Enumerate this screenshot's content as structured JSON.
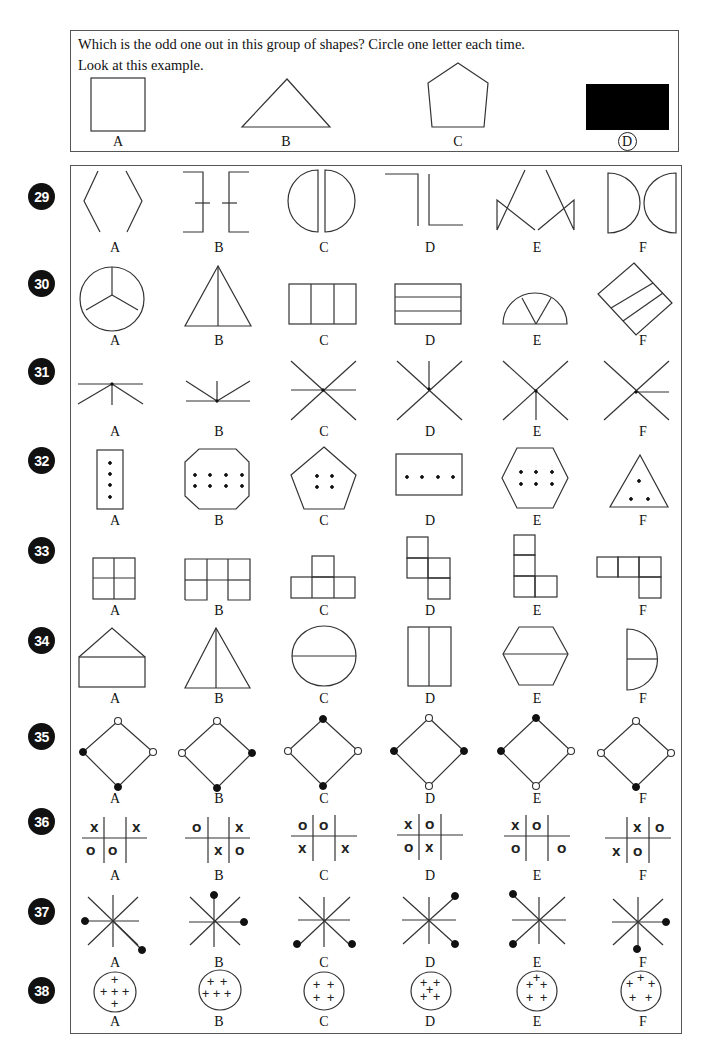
{
  "instructions": {
    "line1": "Which is the odd one out in this group of shapes? Circle one letter each time.",
    "line2": "Look at this example."
  },
  "example": {
    "options": [
      {
        "letter": "A",
        "shape": "square",
        "circled": false
      },
      {
        "letter": "B",
        "shape": "triangle",
        "circled": false
      },
      {
        "letter": "C",
        "shape": "pentagon",
        "circled": false
      },
      {
        "letter": "D",
        "shape": "filled-rectangle",
        "circled": true
      }
    ]
  },
  "questions": [
    {
      "number": "29",
      "letters": [
        "A",
        "B",
        "C",
        "D",
        "E",
        "F"
      ],
      "theme": "split symmetric line pairs"
    },
    {
      "number": "30",
      "letters": [
        "A",
        "B",
        "C",
        "D",
        "E",
        "F"
      ],
      "theme": "shapes divided into three parts"
    },
    {
      "number": "31",
      "letters": [
        "A",
        "B",
        "C",
        "D",
        "E",
        "F"
      ],
      "theme": "lines radiating from a point"
    },
    {
      "number": "32",
      "letters": [
        "A",
        "B",
        "C",
        "D",
        "E",
        "F"
      ],
      "theme": "polygons containing dots"
    },
    {
      "number": "33",
      "letters": [
        "A",
        "B",
        "C",
        "D",
        "E",
        "F"
      ],
      "theme": "square tile arrangements"
    },
    {
      "number": "34",
      "letters": [
        "A",
        "B",
        "C",
        "D",
        "E",
        "F"
      ],
      "theme": "shapes bisected by a line"
    },
    {
      "number": "35",
      "letters": [
        "A",
        "B",
        "C",
        "D",
        "E",
        "F"
      ],
      "theme": "diamonds with filled and hollow corner dots"
    },
    {
      "number": "36",
      "letters": [
        "A",
        "B",
        "C",
        "D",
        "E",
        "F"
      ],
      "theme": "noughts and crosses grids",
      "grids": [
        [
          "X",
          "",
          "X",
          "O",
          "O",
          ""
        ],
        [
          "O",
          "",
          "X",
          "",
          "X",
          "O"
        ],
        [
          "O",
          "O",
          "",
          "X",
          "",
          "X"
        ],
        [
          "X",
          "O",
          "",
          "O",
          "X",
          ""
        ],
        [
          "X",
          "O",
          "",
          "O",
          "",
          "O"
        ],
        [
          "",
          "X",
          "O",
          "X",
          "O",
          ""
        ]
      ]
    },
    {
      "number": "37",
      "letters": [
        "A",
        "B",
        "C",
        "D",
        "E",
        "F"
      ],
      "theme": "eight-spoke stars with two dotted ends"
    },
    {
      "number": "38",
      "letters": [
        "A",
        "B",
        "C",
        "D",
        "E",
        "F"
      ],
      "theme": "circles containing plus signs",
      "plus_symbol": "+"
    }
  ]
}
